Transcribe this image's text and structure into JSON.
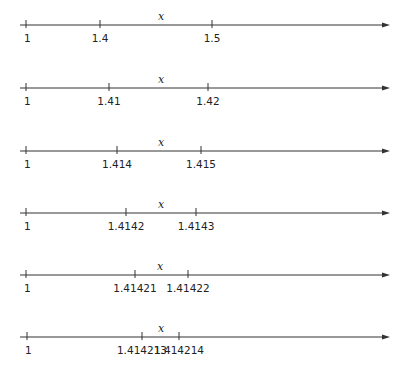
{
  "variable_label": "x",
  "lines": [
    {
      "y": 25,
      "x_label_pos": 161,
      "ticks": [
        {
          "x": 26,
          "label": "1"
        },
        {
          "x": 100,
          "label": "1.4"
        },
        {
          "x": 212,
          "label": "1.5"
        }
      ]
    },
    {
      "y": 88,
      "x_label_pos": 161,
      "ticks": [
        {
          "x": 26,
          "label": "1"
        },
        {
          "x": 109,
          "label": "1.41"
        },
        {
          "x": 208,
          "label": "1.42"
        }
      ]
    },
    {
      "y": 151,
      "x_label_pos": 161,
      "ticks": [
        {
          "x": 26,
          "label": "1"
        },
        {
          "x": 117,
          "label": "1.414"
        },
        {
          "x": 201,
          "label": "1.415"
        }
      ]
    },
    {
      "y": 213,
      "x_label_pos": 161,
      "ticks": [
        {
          "x": 26,
          "label": "1"
        },
        {
          "x": 126,
          "label": "1.4142"
        },
        {
          "x": 196,
          "label": "1.4143"
        }
      ]
    },
    {
      "y": 275,
      "x_label_pos": 160,
      "ticks": [
        {
          "x": 26,
          "label": "1"
        },
        {
          "x": 135,
          "label": "1.41421"
        },
        {
          "x": 188,
          "label": "1.41422"
        }
      ]
    },
    {
      "y": 337,
      "x_label_pos": 161,
      "ticks": [
        {
          "x": 27,
          "label": "1"
        },
        {
          "x": 142,
          "label": "1.414213"
        },
        {
          "x": 179,
          "label": "1.414214"
        }
      ]
    }
  ],
  "axis": {
    "x_start": 20,
    "x_end": 390,
    "color": "#333333"
  }
}
